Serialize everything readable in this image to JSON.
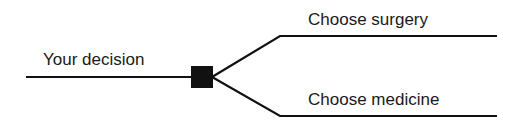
{
  "diagram": {
    "type": "decision-tree",
    "root": {
      "label": "Your decision",
      "node_type": "decision-square"
    },
    "branches": [
      {
        "label": "Choose surgery"
      },
      {
        "label": "Choose medicine"
      }
    ],
    "colors": {
      "line": "#111111",
      "node": "#111111",
      "background": "#ffffff"
    }
  }
}
